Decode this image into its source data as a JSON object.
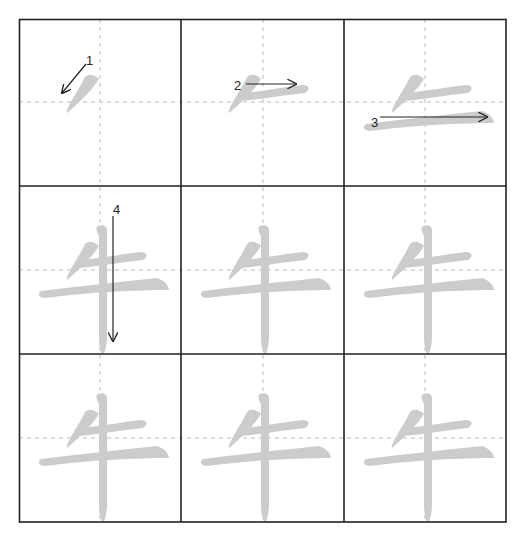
{
  "worksheet": {
    "character": "牛",
    "grid": {
      "rows": 3,
      "cols": 3,
      "x": [
        19,
        181,
        344,
        506
      ],
      "y": [
        19,
        186,
        354,
        522
      ]
    },
    "colors": {
      "border": "#222222",
      "guide": "#bdbdbd",
      "stroke": "#cccccc",
      "arrow": "#222222"
    },
    "cells": [
      {
        "index": 1,
        "strokes_shown": 1,
        "annotation": {
          "number": "1",
          "direction": "down-left"
        }
      },
      {
        "index": 2,
        "strokes_shown": 2,
        "annotation": {
          "number": "2",
          "direction": "right"
        }
      },
      {
        "index": 3,
        "strokes_shown": 3,
        "annotation": {
          "number": "3",
          "direction": "right"
        }
      },
      {
        "index": 4,
        "strokes_shown": 4,
        "annotation": {
          "number": "4",
          "direction": "down"
        }
      },
      {
        "index": 5,
        "strokes_shown": 4
      },
      {
        "index": 6,
        "strokes_shown": 4
      },
      {
        "index": 7,
        "strokes_shown": 4
      },
      {
        "index": 8,
        "strokes_shown": 4
      },
      {
        "index": 9,
        "strokes_shown": 4
      }
    ],
    "labels": {
      "n1": "1",
      "n2": "2",
      "n3": "3",
      "n4": "4"
    }
  }
}
